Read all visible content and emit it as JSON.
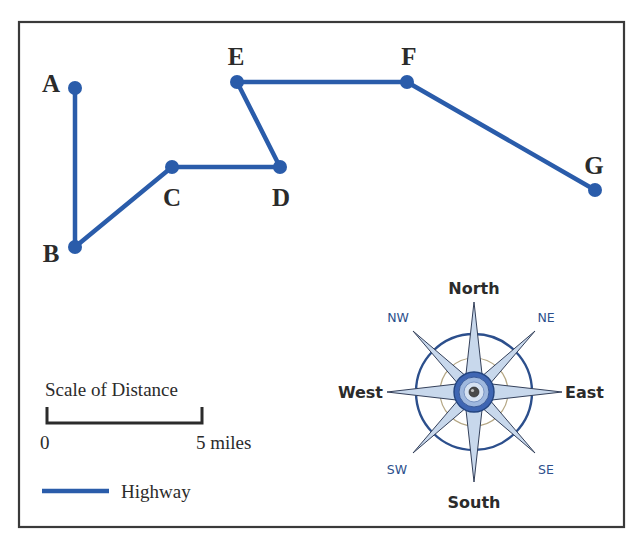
{
  "map": {
    "colors": {
      "highway": "#2a5caa",
      "frame": "#3a3a3a",
      "text": "#2b2b2b",
      "compass_accent": "#2c4f8c"
    },
    "points": [
      {
        "id": "A",
        "label": "A",
        "x": 75,
        "y": 88,
        "label_x": 51,
        "label_y": 92
      },
      {
        "id": "B",
        "label": "B",
        "x": 75,
        "y": 247,
        "label_x": 51,
        "label_y": 262
      },
      {
        "id": "C",
        "label": "C",
        "x": 172,
        "y": 167,
        "label_x": 172,
        "label_y": 206
      },
      {
        "id": "D",
        "label": "D",
        "x": 280,
        "y": 167,
        "label_x": 281,
        "label_y": 206
      },
      {
        "id": "E",
        "label": "E",
        "x": 237,
        "y": 82,
        "label_x": 236,
        "label_y": 65
      },
      {
        "id": "F",
        "label": "F",
        "x": 407,
        "y": 82,
        "label_x": 409,
        "label_y": 65
      },
      {
        "id": "G",
        "label": "G",
        "x": 595,
        "y": 190,
        "label_x": 594,
        "label_y": 174
      }
    ],
    "highway_route": [
      "A",
      "B",
      "C",
      "D",
      "E",
      "F",
      "G"
    ],
    "scale": {
      "title": "Scale of Distance",
      "start_label": "0",
      "end_label": "5 miles",
      "distance_miles": 5
    },
    "legend": {
      "highway_label": "Highway"
    },
    "compass": {
      "north": "North",
      "south": "South",
      "east": "East",
      "west": "West",
      "northeast": "NE",
      "northwest": "NW",
      "southeast": "SE",
      "southwest": "SW"
    }
  }
}
